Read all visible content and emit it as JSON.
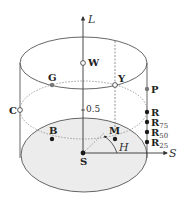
{
  "diagram": {
    "axes": {
      "vertical": {
        "label": "L"
      },
      "radial": {
        "label": "S"
      },
      "angle": {
        "label": "H"
      },
      "midlevel_tick": "0.5"
    },
    "points": [
      {
        "id": "W",
        "label": "W",
        "style": "open"
      },
      {
        "id": "G",
        "label": "G",
        "style": "gray"
      },
      {
        "id": "Y",
        "label": "Y",
        "style": "open"
      },
      {
        "id": "P",
        "label": "P",
        "style": "gray"
      },
      {
        "id": "C",
        "label": "C",
        "style": "open"
      },
      {
        "id": "R",
        "label": "R",
        "style": "filled"
      },
      {
        "id": "R75",
        "label": "R",
        "subscript": "75",
        "style": "filled"
      },
      {
        "id": "R50",
        "label": "R",
        "subscript": "50",
        "style": "filled"
      },
      {
        "id": "R25",
        "label": "R",
        "subscript": "25",
        "style": "filled"
      },
      {
        "id": "B",
        "label": "B",
        "style": "filled"
      },
      {
        "id": "M",
        "label": "M",
        "style": "filled"
      },
      {
        "id": "S",
        "label": "S",
        "style": "filled"
      }
    ],
    "colors": {
      "stroke": "#555555",
      "dashed": "#888888",
      "base_fill": "#ececec",
      "point_filled": "#1a1a1a",
      "point_gray": "#777777",
      "point_open": "#ffffff"
    }
  }
}
